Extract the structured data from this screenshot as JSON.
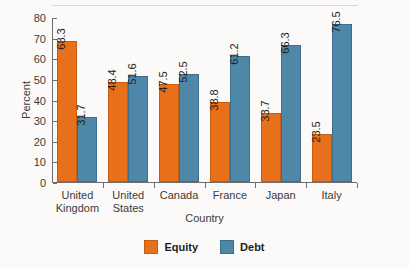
{
  "chart_data": {
    "type": "bar",
    "title": "",
    "xlabel": "Country",
    "ylabel": "Percent",
    "ylim": [
      0,
      80
    ],
    "yticks": [
      0,
      10,
      20,
      30,
      40,
      50,
      60,
      70,
      80
    ],
    "grid": false,
    "legend_position": "bottom-center",
    "categories": [
      "United Kingdom",
      "United States",
      "Canada",
      "France",
      "Japan",
      "Italy"
    ],
    "category_lines": [
      [
        "United",
        "Kingdom"
      ],
      [
        "United",
        "States"
      ],
      [
        "Canada"
      ],
      [
        "France"
      ],
      [
        "Japan"
      ],
      [
        "Italy"
      ]
    ],
    "series": [
      {
        "name": "Equity",
        "color": "#e8701a",
        "values": [
          68.3,
          48.4,
          47.5,
          38.8,
          33.7,
          23.5
        ]
      },
      {
        "name": "Debt",
        "color": "#4e87a8",
        "values": [
          31.7,
          51.6,
          52.5,
          61.2,
          66.3,
          76.5
        ]
      }
    ],
    "value_labels": [
      [
        "68.3",
        "31.7"
      ],
      [
        "48.4",
        "51.6"
      ],
      [
        "47.5",
        "52.5"
      ],
      [
        "38.8",
        "61.2"
      ],
      [
        "33.7",
        "66.3"
      ],
      [
        "23.5",
        "76.5"
      ]
    ]
  },
  "legend": {
    "items": [
      {
        "label": "Equity",
        "color": "#e8701a"
      },
      {
        "label": "Debt",
        "color": "#4e87a8"
      }
    ]
  }
}
